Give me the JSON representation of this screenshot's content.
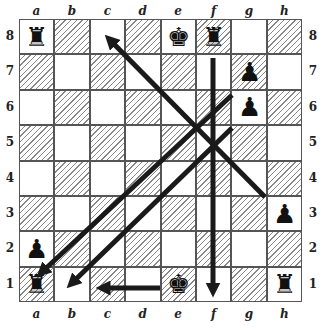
{
  "files": [
    "a",
    "b",
    "c",
    "d",
    "e",
    "f",
    "g",
    "h"
  ],
  "ranks": [
    "8",
    "7",
    "6",
    "5",
    "4",
    "3",
    "2",
    "1"
  ],
  "pieces": [
    {
      "square": "a8",
      "glyph": "♜",
      "name": "black-rook"
    },
    {
      "square": "e8",
      "glyph": "♚",
      "name": "black-king"
    },
    {
      "square": "f8",
      "glyph": "♜",
      "name": "black-rook"
    },
    {
      "square": "g7",
      "glyph": "♟",
      "name": "black-pawn"
    },
    {
      "square": "g6",
      "glyph": "♟",
      "name": "black-pawn"
    },
    {
      "square": "h3",
      "glyph": "♟",
      "name": "black-pawn"
    },
    {
      "square": "a2",
      "glyph": "♟",
      "name": "black-pawn"
    },
    {
      "square": "a1",
      "glyph": "♜",
      "name": "black-rook"
    },
    {
      "square": "e1",
      "glyph": "♚",
      "name": "black-king"
    },
    {
      "square": "h1",
      "glyph": "♜",
      "name": "black-rook"
    }
  ],
  "arrows": [
    {
      "name": "arrow-g3-to-c8",
      "x1": 265,
      "y1": 197,
      "x2": 110,
      "y2": 40
    },
    {
      "name": "arrow-g6-to-a1",
      "x1": 232,
      "y1": 95,
      "x2": 42,
      "y2": 272
    },
    {
      "name": "arrow-g5-to-b1",
      "x1": 232,
      "y1": 128,
      "x2": 72,
      "y2": 283
    },
    {
      "name": "arrow-f8-to-f1",
      "x1": 213,
      "y1": 58,
      "x2": 213,
      "y2": 290
    },
    {
      "name": "arrow-e1-to-c1",
      "x1": 160,
      "y1": 288,
      "x2": 103,
      "y2": 288
    }
  ],
  "caption": ""
}
